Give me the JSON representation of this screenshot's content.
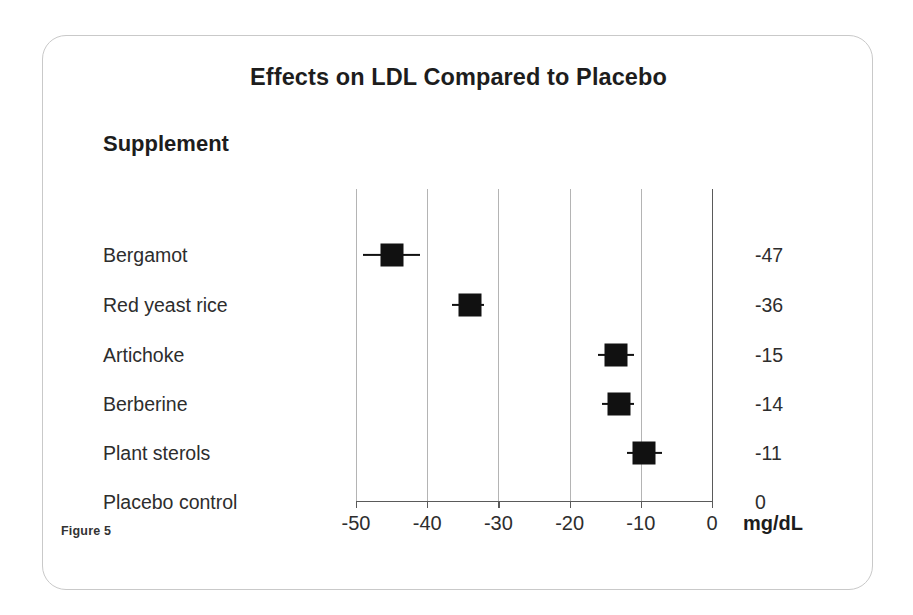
{
  "figure": {
    "title": "Effects on LDL Compared to Placebo",
    "column_header": "Supplement",
    "caption": "Figure 5",
    "unit_label": "mg/dL"
  },
  "chart_data": {
    "type": "scatter",
    "subtype": "forest-plot",
    "title": "Effects on LDL Compared to Placebo",
    "xlabel": "mg/dL",
    "ylabel": "Supplement",
    "xlim": [
      -50,
      0
    ],
    "xticks": [
      -50,
      -40,
      -30,
      -20,
      -10,
      0
    ],
    "xticklabels": [
      "-50",
      "-40",
      "-30",
      "-20",
      "-10",
      "0"
    ],
    "grid": "vertical",
    "legend": "none",
    "categories": [
      "Bergamot",
      "Red yeast rice",
      "Artichoke",
      "Berberine",
      "Plant sterols",
      "Placebo control"
    ],
    "values": [
      -45,
      -34,
      -13.5,
      -13,
      -9.5,
      0
    ],
    "value_labels": [
      "-47",
      "-36",
      "-15",
      "-14",
      "-11",
      "0"
    ],
    "error_low": [
      -49,
      -36.5,
      -16,
      -15.5,
      -12,
      null
    ],
    "error_high": [
      -41,
      -32,
      -11,
      -11,
      -7,
      null
    ],
    "points": [
      {
        "label": "Bergamot",
        "value": -45,
        "display": "-47",
        "ci_low": -49,
        "ci_high": -41,
        "has_marker": true
      },
      {
        "label": "Red yeast rice",
        "value": -34,
        "display": "-36",
        "ci_low": -36.5,
        "ci_high": -32,
        "has_marker": true
      },
      {
        "label": "Artichoke",
        "value": -13.5,
        "display": "-15",
        "ci_low": -16,
        "ci_high": -11,
        "has_marker": true
      },
      {
        "label": "Berberine",
        "value": -13,
        "display": "-14",
        "ci_low": -15.5,
        "ci_high": -11,
        "has_marker": true
      },
      {
        "label": "Plant sterols",
        "value": -9.5,
        "display": "-11",
        "ci_low": -12,
        "ci_high": -7,
        "has_marker": true
      },
      {
        "label": "Placebo control",
        "value": 0,
        "display": "0",
        "ci_low": null,
        "ci_high": null,
        "has_marker": false
      }
    ]
  },
  "colors": {
    "marker": "#111111",
    "gridline": "#b4b4b4",
    "axis": "#5a5a5a",
    "text": "#2d2d2d",
    "card_border": "#c9c9c9",
    "background": "#ffffff"
  }
}
